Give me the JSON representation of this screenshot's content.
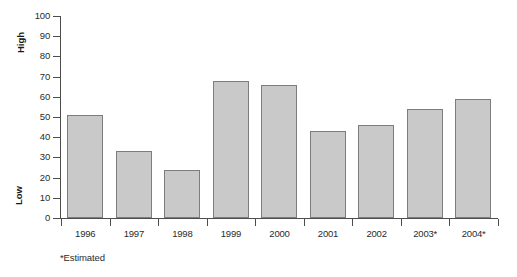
{
  "chart_data": {
    "type": "bar",
    "title": "",
    "xlabel": "",
    "ylabel": "",
    "categories": [
      "1996",
      "1997",
      "1998",
      "1999",
      "2000",
      "2001",
      "2002",
      "2003*",
      "2004*"
    ],
    "values": [
      51,
      33,
      24,
      68,
      66,
      43,
      46,
      54,
      59
    ],
    "ylim": [
      0,
      100
    ],
    "ytick_values": [
      0,
      10,
      20,
      30,
      40,
      50,
      60,
      70,
      80,
      90,
      100
    ],
    "ytick_labels": [
      "0",
      "10",
      "20",
      "30",
      "40",
      "50",
      "60",
      "70",
      "80",
      "90",
      "100"
    ],
    "grid": false,
    "legend": null,
    "axis_side_labels": {
      "top": "High",
      "bottom": "Low"
    },
    "annotations": [
      "*Estimated"
    ],
    "series": [
      {
        "name": "",
        "values": [
          51,
          33,
          24,
          68,
          66,
          43,
          46,
          54,
          59
        ]
      }
    ],
    "colors": {
      "bar_fill": "#c9c9c9",
      "bar_stroke": "#7d7d7d",
      "axis": "#4d4d4d",
      "text": "#2b2b2b",
      "background": "#ffffff"
    }
  },
  "footnote": {
    "text": "*Estimated"
  },
  "axis_labels": {
    "high": "High",
    "low": "Low"
  }
}
